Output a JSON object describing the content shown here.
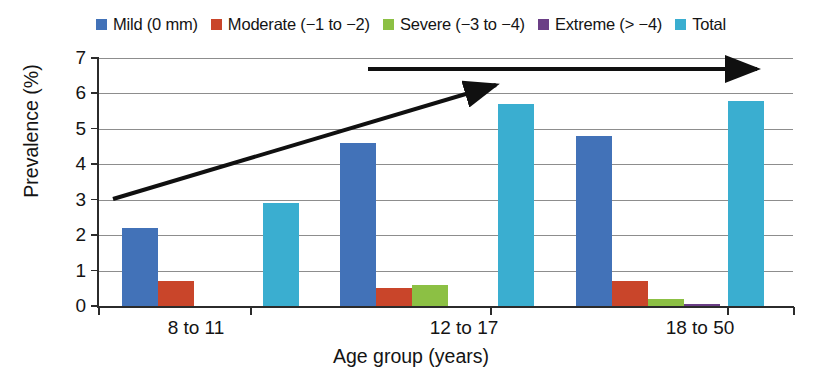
{
  "chart_data": {
    "type": "bar",
    "title": "",
    "xlabel": "Age group (years)",
    "ylabel": "Prevalence (%)",
    "categories": [
      "8 to 11",
      "12 to 17",
      "18 to 50"
    ],
    "ylim": [
      0,
      7
    ],
    "yticks": [
      "0",
      "1",
      "2",
      "3",
      "4",
      "5",
      "6",
      "7"
    ],
    "grid": true,
    "legend_position": "top-center",
    "series": [
      {
        "name": "Mild (0 mm)",
        "color": "#4272b8",
        "values": [
          2.2,
          4.6,
          4.8
        ]
      },
      {
        "name": "Moderate (−1 to −2)",
        "color": "#c9452a",
        "values": [
          0.7,
          0.5,
          0.7
        ]
      },
      {
        "name": "Severe (−3 to −4)",
        "color": "#8cc044",
        "values": [
          0.0,
          0.6,
          0.2
        ]
      },
      {
        "name": "Extreme (> −4)",
        "color": "#6b3f86",
        "values": [
          0.0,
          0.0,
          0.05
        ]
      },
      {
        "name": "Total",
        "color": "#3aaed0",
        "values": [
          2.9,
          5.7,
          5.8
        ]
      }
    ],
    "annotations": [
      {
        "name": "rising-trend-arrow",
        "type": "arrow",
        "from": [
          0.55,
          2.95
        ],
        "to": [
          3.55,
          6.2
        ]
      },
      {
        "name": "horizontal-trend-arrow",
        "type": "arrow",
        "from": [
          2.35,
          6.75
        ],
        "to": [
          5.5,
          6.75
        ]
      }
    ]
  },
  "legend": {
    "items": [
      {
        "label": "Mild (0 mm)",
        "color": "#4272b8"
      },
      {
        "label": "Moderate (−1 to −2)",
        "color": "#c9452a"
      },
      {
        "label": "Severe (−3 to −4)",
        "color": "#8cc044"
      },
      {
        "label": "Extreme (> −4)",
        "color": "#6b3f86"
      },
      {
        "label": "Total",
        "color": "#3aaed0"
      }
    ]
  },
  "axes": {
    "y_title": "Prevalence (%)",
    "x_title": "Age group (years)",
    "y_ticks": [
      "7",
      "6",
      "5",
      "4",
      "3",
      "2",
      "1",
      "0"
    ],
    "x_ticks": [
      "8 to 11",
      "12 to 17",
      "18 to 50"
    ]
  }
}
